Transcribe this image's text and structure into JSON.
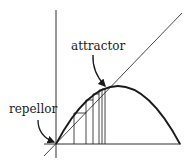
{
  "diagram": {
    "type": "cobweb plot",
    "labels": {
      "attractor": "attractor",
      "repellor": "repellor"
    },
    "colors": {
      "ink": "#1a1a1a",
      "background": "#ffffff"
    },
    "elements": [
      "y-axis",
      "x-axis",
      "identity diagonal line",
      "parabolic map curve",
      "cobweb iteration steps",
      "arrow to attractor fixed point",
      "arrow to repellor fixed point"
    ]
  }
}
